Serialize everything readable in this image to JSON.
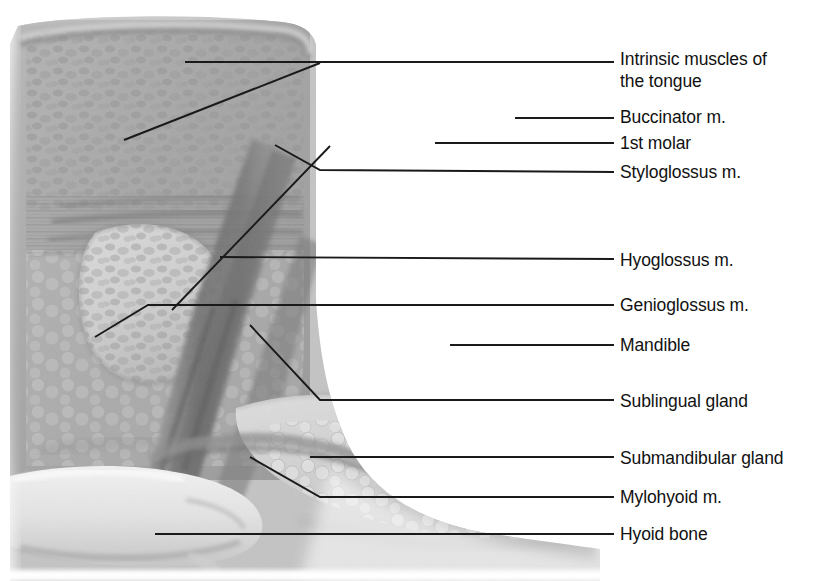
{
  "figure": {
    "background_color": "#ffffff",
    "label_color": "#111111",
    "leader_color": "#1a1a1a",
    "width": 825,
    "height": 581
  },
  "labels": [
    {
      "id": "intrinsic-muscles-of-the-tongue",
      "text": "Intrinsic muscles of",
      "text_line2": "the tongue",
      "x": 620,
      "y": 48,
      "leader": {
        "type": "polyline",
        "points": "185,62 320,62"
      },
      "pointer": {
        "type": "diagonal",
        "points": "185,62 320,63"
      }
    },
    {
      "id": "buccinator-m",
      "text": "Buccinator m.",
      "x": 620,
      "y": 106,
      "leader": {
        "type": "line",
        "points": "515,118 614,118"
      }
    },
    {
      "id": "first-molar",
      "text": "1st molar",
      "x": 620,
      "y": 132,
      "leader": {
        "type": "line",
        "points": "435,143 614,143"
      }
    },
    {
      "id": "styloglossus-m",
      "text": "Styloglossus m.",
      "x": 620,
      "y": 161,
      "leader": {
        "type": "polyline",
        "points": "275,145 320,170 614,172"
      }
    },
    {
      "id": "hyoglossus-m",
      "text": "Hyoglossus m.",
      "x": 620,
      "y": 249,
      "leader": {
        "type": "line",
        "points": "220,257 614,260"
      }
    },
    {
      "id": "genioglossus-m",
      "text": "Genioglossus m.",
      "x": 620,
      "y": 294,
      "leader": {
        "type": "polyline",
        "points": "95,337 148,305 614,305"
      }
    },
    {
      "id": "mandible",
      "text": "Mandible",
      "x": 620,
      "y": 334,
      "leader": {
        "type": "line",
        "points": "450,345 614,345"
      }
    },
    {
      "id": "sublingual-gland",
      "text": "Sublingual gland",
      "x": 620,
      "y": 390,
      "leader": {
        "type": "polyline",
        "points": "250,325 320,400 614,400"
      }
    },
    {
      "id": "submandibular-gland",
      "text": "Submandibular gland",
      "x": 620,
      "y": 447,
      "leader": {
        "type": "line",
        "points": "310,457 614,457"
      }
    },
    {
      "id": "mylohyoid-m",
      "text": "Mylohyoid m.",
      "x": 620,
      "y": 486,
      "leader": {
        "type": "polyline",
        "points": "250,457 320,497 614,497"
      }
    },
    {
      "id": "hyoid-bone",
      "text": "Hyoid bone",
      "x": 620,
      "y": 523,
      "leader": {
        "type": "line",
        "points": "155,534 614,534"
      }
    }
  ],
  "structures": {
    "tongue_body": "Intrinsic muscles of the tongue",
    "tooth": "1st molar",
    "bone": "Mandible",
    "hyoid": "Hyoid bone",
    "glands": [
      "Sublingual gland",
      "Submandibular gland"
    ],
    "muscles": [
      "Buccinator m.",
      "Styloglossus m.",
      "Hyoglossus m.",
      "Genioglossus m.",
      "Mylohyoid m."
    ]
  }
}
